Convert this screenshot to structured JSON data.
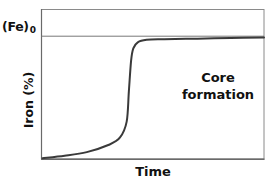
{
  "chart_data": {
    "type": "line",
    "title": "",
    "xlabel": "Time",
    "ylabel": "Iron (%)",
    "reference_line": {
      "label": "(Fe)",
      "subscript": "0",
      "description": "initial/maximum iron level"
    },
    "annotation": {
      "line1": "Core",
      "line2": "formation"
    },
    "x_ticks": [],
    "y_ticks": [],
    "grid": false,
    "legend": false,
    "xlim": [
      0,
      1
    ],
    "ylim": [
      0,
      1
    ],
    "series": [
      {
        "name": "Iron (%)",
        "x": [
          0.0,
          0.1,
          0.2,
          0.3,
          0.35,
          0.38,
          0.39,
          0.4,
          0.41,
          0.43,
          0.47,
          0.55,
          0.7,
          0.85,
          1.0
        ],
        "y": [
          0.0,
          0.02,
          0.05,
          0.11,
          0.17,
          0.3,
          0.55,
          0.8,
          0.9,
          0.95,
          0.97,
          0.975,
          0.98,
          0.985,
          0.99
        ]
      }
    ],
    "colors": {
      "curve": "#3a3a3a",
      "axes": "#555555",
      "reference_line": "#666666",
      "text": "#111111"
    }
  },
  "labels": {
    "ref_main": "(Fe)",
    "ref_sub": "0",
    "y_axis": "Iron (%)",
    "x_axis": "Time",
    "annotation_line1": "Core",
    "annotation_line2": "formation"
  }
}
